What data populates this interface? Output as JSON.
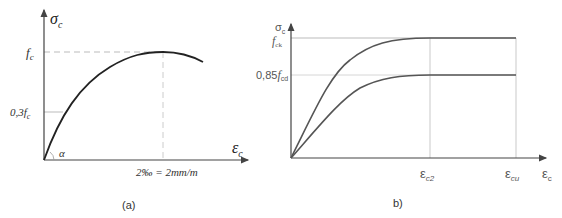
{
  "diagram_a": {
    "y_axis_label": "σ",
    "y_axis_sub": "c",
    "x_axis_label": "ε",
    "x_axis_sub": "c",
    "peak_label": "f",
    "peak_sub": "c",
    "low_label": "0,3f",
    "low_sub": "c",
    "angle_label": "α",
    "x_tick_label": "2‰ = 2mm/m",
    "caption": "(a)"
  },
  "diagram_b": {
    "y_axis_label": "σ",
    "y_axis_sub": "c",
    "x_axis_label": "ε",
    "x_axis_sub": "c",
    "upper_label": "f",
    "upper_sub": "ck",
    "lower_prefix": "0,85",
    "lower_label": "f",
    "lower_sub": "cd",
    "tick1_label": "ε",
    "tick1_sub": "c2",
    "tick2_label": "ε",
    "tick2_sub": "cu",
    "caption": "b)"
  },
  "colors": {
    "axis": "#444444",
    "curve": "#222222",
    "curve_b": "#555555",
    "guide": "#bbbbbb"
  }
}
